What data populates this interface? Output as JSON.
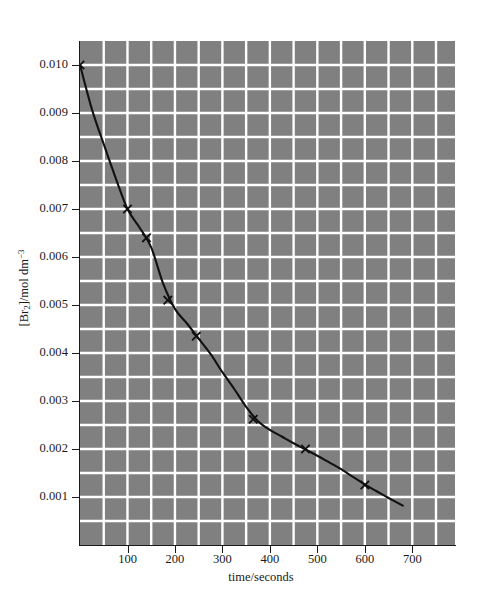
{
  "chart_data": {
    "type": "line",
    "title": "",
    "xlabel": "time/seconds",
    "ylabel_html": "[Br<sub>2</sub>]/mol dm<sup>&#8722;3</sup>",
    "ylabel_text": "[Br2]/mol dm-3",
    "xlim": [
      0,
      790
    ],
    "ylim": [
      0,
      0.0105
    ],
    "x_ticks": [
      100,
      200,
      300,
      400,
      500,
      600,
      700
    ],
    "x_tick_labels": [
      "100",
      "200",
      "300",
      "400",
      "500",
      "600",
      "700"
    ],
    "y_ticks": [
      0.001,
      0.002,
      0.003,
      0.004,
      0.005,
      0.006,
      0.007,
      0.008,
      0.009,
      0.01
    ],
    "y_tick_labels": [
      "0.001",
      "0.002",
      "0.003",
      "0.004",
      "0.005",
      "0.006",
      "0.007",
      "0.008",
      "0.009",
      "0.010"
    ],
    "grid": true,
    "grid_x_step": 50,
    "grid_y_step": 0.0005,
    "grid_color": "#ffffff",
    "plot_bg_color": "#808080",
    "curve_color": "#111111",
    "marker": "x",
    "legend": null,
    "series": [
      {
        "name": "[Br2] vs time",
        "points": [
          {
            "x": 0,
            "y": 0.01
          },
          {
            "x": 100,
            "y": 0.007
          },
          {
            "x": 140,
            "y": 0.0064
          },
          {
            "x": 185,
            "y": 0.0051
          },
          {
            "x": 245,
            "y": 0.00435
          },
          {
            "x": 365,
            "y": 0.00262
          },
          {
            "x": 475,
            "y": 0.002
          },
          {
            "x": 600,
            "y": 0.00125
          }
        ],
        "curve": [
          {
            "x": 0,
            "y": 0.01
          },
          {
            "x": 25,
            "y": 0.00908
          },
          {
            "x": 50,
            "y": 0.00835
          },
          {
            "x": 75,
            "y": 0.00765
          },
          {
            "x": 100,
            "y": 0.007
          },
          {
            "x": 125,
            "y": 0.00662
          },
          {
            "x": 150,
            "y": 0.0062
          },
          {
            "x": 175,
            "y": 0.00545
          },
          {
            "x": 200,
            "y": 0.00492
          },
          {
            "x": 225,
            "y": 0.00462
          },
          {
            "x": 250,
            "y": 0.0043
          },
          {
            "x": 275,
            "y": 0.00398
          },
          {
            "x": 300,
            "y": 0.0036
          },
          {
            "x": 325,
            "y": 0.00325
          },
          {
            "x": 350,
            "y": 0.00288
          },
          {
            "x": 375,
            "y": 0.00258
          },
          {
            "x": 400,
            "y": 0.0024
          },
          {
            "x": 425,
            "y": 0.00226
          },
          {
            "x": 450,
            "y": 0.00212
          },
          {
            "x": 475,
            "y": 0.00199
          },
          {
            "x": 500,
            "y": 0.00186
          },
          {
            "x": 525,
            "y": 0.00172
          },
          {
            "x": 550,
            "y": 0.00158
          },
          {
            "x": 575,
            "y": 0.00142
          },
          {
            "x": 600,
            "y": 0.00126
          },
          {
            "x": 625,
            "y": 0.00112
          },
          {
            "x": 650,
            "y": 0.00098
          },
          {
            "x": 680,
            "y": 0.00082
          }
        ]
      }
    ]
  }
}
